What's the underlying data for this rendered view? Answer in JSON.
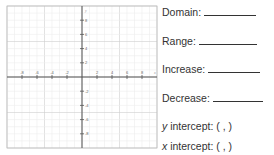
{
  "worksheet": {
    "fields": [
      {
        "label": "Domain:",
        "blank": true
      },
      {
        "label": "Range:",
        "blank": true
      },
      {
        "label": "Increase:",
        "blank": true
      },
      {
        "label": "Decrease:",
        "blank": true
      },
      {
        "prefix": "y",
        "label": " intercept: (  ,  )",
        "blank": false
      },
      {
        "prefix": "x",
        "label": " intercept: (  ,  )",
        "blank": false
      }
    ]
  },
  "graph": {
    "x_axis_label": "x",
    "y_axis_label": "y",
    "x_range": [
      -10,
      10
    ],
    "y_range": [
      -10,
      10
    ],
    "tick_step": 2,
    "x_tick_labels": [
      "-8",
      "-6",
      "-4",
      "-2",
      "2",
      "4",
      "6",
      "8"
    ],
    "y_tick_labels": [
      "8",
      "6",
      "4",
      "2",
      "-2",
      "-4",
      "-6",
      "-8"
    ]
  }
}
